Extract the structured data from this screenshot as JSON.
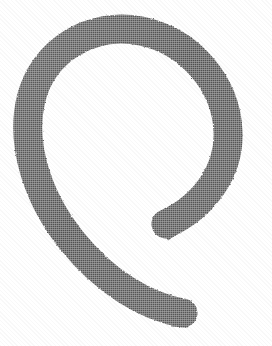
{
  "canvas": {
    "width": 272,
    "height": 346,
    "background_color": "#ffffff",
    "alt_text": "Scanned hand-drawn open spiral glyph"
  },
  "glyph": {
    "name": "open-spiral-glyph",
    "description": "Hand-drawn lowercase e / open circular hook",
    "stroke_color": "#545454",
    "stroke_color_dark": "#4a4a4a",
    "stroke_color_light": "#5e5e5e",
    "stroke_width_px": 29,
    "bounds": {
      "x_min": 22,
      "x_max": 250,
      "y_min": 22,
      "y_max": 322
    },
    "terminals": {
      "inner_tip": {
        "x": 166,
        "y": 236,
        "style": "blunt-angled"
      },
      "tail_tip": {
        "x": 190,
        "y": 310,
        "style": "blunt-rounded"
      }
    },
    "outline_path": "M 166.5 212.5 C 186 202 205 186 216 167 C 228 146 231 120 226 96 C 220 70 202 48 177 35 C 151 21 120 18 92 28 C 64 38 41 61 31 90 C 20 121 23 157 38 189 C 52 219 74 248 99 271 C 122 292 149 307 176 313 L 189.5 315 L 191 296 L 178 293 C 154 288 129 274 108 255 C 85 234 65 208 53 181 C 39 152 36 121 45 96 C 53 72 72 53 96 45 C 120 37 147 40 168 52 C 189 64 204 83 209 105 C 214 126 211 148 201 165 C 192 181 176 194 159 202 Z",
    "centerline_path": "M 166 224 C 205 206 230 170 228 131 C 226 84 190 41 141 31 C 92 21 43 50 31 99 C 20 145 38 199 72 241 C 104 281 146 307 183 313"
  }
}
